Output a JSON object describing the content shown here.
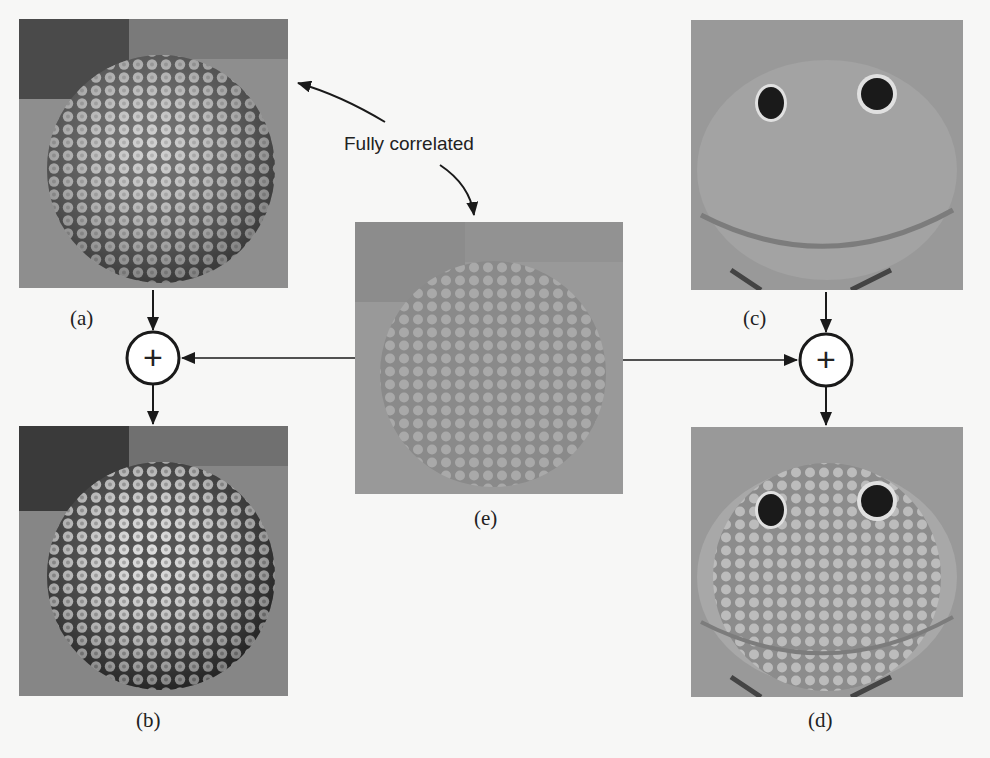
{
  "figure": {
    "annotation": "Fully correlated",
    "panels": [
      {
        "id": "a",
        "label": "(a)",
        "subject": "textured sphere (original)"
      },
      {
        "id": "b",
        "label": "(b)",
        "subject": "textured sphere (a + e)"
      },
      {
        "id": "c",
        "label": "(c)",
        "subject": "plush frog face (original)"
      },
      {
        "id": "d",
        "label": "(d)",
        "subject": "frog face with sphere texture (c + e)"
      },
      {
        "id": "e",
        "label": "(e)",
        "subject": "low-contrast sphere texture (shared component)"
      }
    ],
    "operators": [
      {
        "id": "sum-left",
        "symbol": "+"
      },
      {
        "id": "sum-right",
        "symbol": "+"
      }
    ],
    "colors": {
      "background": "#f7f7f6",
      "ink": "#1a1a1a"
    }
  }
}
